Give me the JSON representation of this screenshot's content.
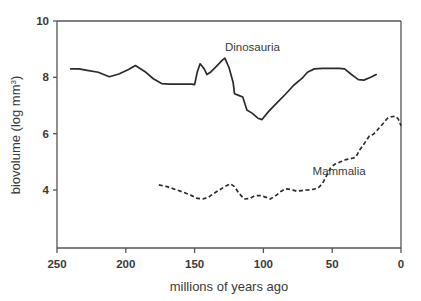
{
  "chart_data": {
    "type": "line",
    "title": "",
    "xlabel": "millions of years ago",
    "ylabel": "biovolume (log mm",
    "ylabel_sup": "3",
    "ylabel_tail": ")",
    "xlim": [
      250,
      0
    ],
    "ylim": [
      2.5,
      10
    ],
    "x_reversed": true,
    "grid": false,
    "legend_position": "inline-annotation",
    "xticks": [
      250,
      200,
      150,
      100,
      50,
      0
    ],
    "xtick_labels": [
      "250",
      "200",
      "150",
      "100",
      "50",
      "0"
    ],
    "yticks": [
      4,
      6,
      8,
      10
    ],
    "ytick_labels": [
      "4",
      "6",
      "8",
      "10"
    ],
    "series": [
      {
        "name": "Dinosauria",
        "style": "solid",
        "label_x": 108,
        "label_y": 8.95,
        "points": [
          [
            240,
            8.3
          ],
          [
            234,
            8.3
          ],
          [
            228,
            8.25
          ],
          [
            220,
            8.18
          ],
          [
            212,
            8.02
          ],
          [
            205,
            8.12
          ],
          [
            198,
            8.28
          ],
          [
            193,
            8.42
          ],
          [
            186,
            8.2
          ],
          [
            180,
            7.95
          ],
          [
            174,
            7.78
          ],
          [
            168,
            7.76
          ],
          [
            160,
            7.76
          ],
          [
            152,
            7.76
          ],
          [
            150,
            7.74
          ],
          [
            148,
            8.2
          ],
          [
            146,
            8.48
          ],
          [
            143,
            8.3
          ],
          [
            141,
            8.1
          ],
          [
            138,
            8.2
          ],
          [
            134,
            8.4
          ],
          [
            130,
            8.6
          ],
          [
            128,
            8.68
          ],
          [
            125,
            8.35
          ],
          [
            122,
            7.82
          ],
          [
            121,
            7.42
          ],
          [
            118,
            7.36
          ],
          [
            115,
            7.3
          ],
          [
            112,
            6.84
          ],
          [
            108,
            6.72
          ],
          [
            104,
            6.55
          ],
          [
            101,
            6.5
          ],
          [
            96,
            6.8
          ],
          [
            90,
            7.1
          ],
          [
            84,
            7.4
          ],
          [
            78,
            7.72
          ],
          [
            72,
            7.96
          ],
          [
            68,
            8.18
          ],
          [
            63,
            8.3
          ],
          [
            57,
            8.32
          ],
          [
            50,
            8.32
          ],
          [
            45,
            8.32
          ],
          [
            41,
            8.3
          ],
          [
            36,
            8.1
          ],
          [
            31,
            7.92
          ],
          [
            27,
            7.9
          ],
          [
            22,
            8.0
          ],
          [
            18,
            8.1
          ]
        ]
      },
      {
        "name": "Mammalia",
        "style": "dashed",
        "label_x": 45,
        "label_y": 4.55,
        "points": [
          [
            176,
            4.18
          ],
          [
            170,
            4.12
          ],
          [
            164,
            4.02
          ],
          [
            158,
            3.92
          ],
          [
            152,
            3.8
          ],
          [
            148,
            3.7
          ],
          [
            144,
            3.68
          ],
          [
            140,
            3.74
          ],
          [
            136,
            3.88
          ],
          [
            132,
            4.0
          ],
          [
            128,
            4.12
          ],
          [
            124,
            4.22
          ],
          [
            121,
            4.12
          ],
          [
            118,
            3.9
          ],
          [
            114,
            3.68
          ],
          [
            110,
            3.7
          ],
          [
            106,
            3.8
          ],
          [
            102,
            3.8
          ],
          [
            98,
            3.74
          ],
          [
            95,
            3.68
          ],
          [
            91,
            3.8
          ],
          [
            87,
            3.96
          ],
          [
            84,
            4.04
          ],
          [
            80,
            4.02
          ],
          [
            76,
            3.96
          ],
          [
            72,
            3.98
          ],
          [
            68,
            4.0
          ],
          [
            64,
            4.02
          ],
          [
            60,
            4.08
          ],
          [
            57,
            4.24
          ],
          [
            54,
            4.52
          ],
          [
            51,
            4.8
          ],
          [
            48,
            4.92
          ],
          [
            44,
            5.0
          ],
          [
            40,
            5.08
          ],
          [
            36,
            5.12
          ],
          [
            33,
            5.16
          ],
          [
            30,
            5.42
          ],
          [
            26,
            5.7
          ],
          [
            23,
            5.92
          ],
          [
            20,
            5.98
          ],
          [
            17,
            6.14
          ],
          [
            13,
            6.36
          ],
          [
            10,
            6.54
          ],
          [
            7,
            6.6
          ],
          [
            4,
            6.62
          ],
          [
            2,
            6.52
          ],
          [
            0,
            6.28
          ]
        ]
      }
    ]
  }
}
